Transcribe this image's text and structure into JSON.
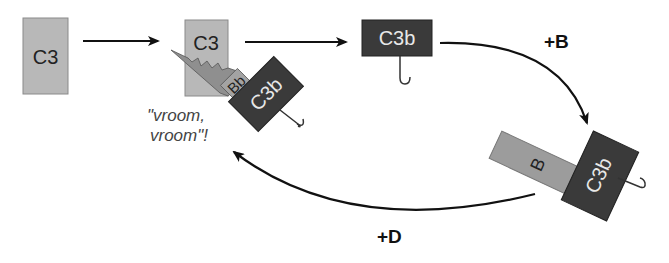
{
  "colors": {
    "c3_fill": "#b8b8b8",
    "c3b_fill": "#3a3a3a",
    "bb_fill": "#8f8f8f",
    "b_fill": "#9c9c9c",
    "arrow": "#111111"
  },
  "nodes": {
    "c3_initial": {
      "label": "C3"
    },
    "c3_cleaving": {
      "label": "C3"
    },
    "bb": {
      "label": "Bb"
    },
    "c3b_convertase": {
      "label": "C3b"
    },
    "c3b_free": {
      "label": "C3b"
    },
    "b_factor": {
      "label": "B"
    },
    "c3b_bound": {
      "label": "C3b"
    }
  },
  "annotations": {
    "vroom_line1": "\"vroom,",
    "vroom_line2": "vroom\"!"
  },
  "edges": {
    "plus_b": "+B",
    "plus_d": "+D"
  }
}
